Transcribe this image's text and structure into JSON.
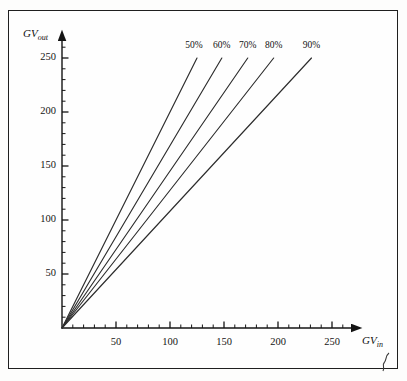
{
  "document": {
    "border_color": "#2a2a2a",
    "background": "#fefefe"
  },
  "chart_data": {
    "type": "line",
    "title": "",
    "subtitle": "",
    "xlabel": "GV",
    "xlabel_sub": "in",
    "ylabel": "GV",
    "ylabel_sub": "out",
    "xlim": [
      0,
      265
    ],
    "ylim": [
      0,
      262
    ],
    "x_major_ticks": [
      50,
      100,
      150,
      200,
      250
    ],
    "x_tick_labels": [
      "50",
      "100",
      "150",
      "200",
      "250"
    ],
    "y_major_ticks": [
      50,
      100,
      150,
      200,
      250
    ],
    "y_tick_labels": [
      "50",
      "100",
      "150",
      "200",
      "250"
    ],
    "minor_tick_interval": 10,
    "grid": false,
    "legend_position": "line-end-labels",
    "line_color": "#2c2c2c",
    "series": [
      {
        "name": "50%",
        "label": "50%",
        "x": [
          0,
          125
        ],
        "values": [
          0,
          250
        ],
        "slope": 2.0
      },
      {
        "name": "60%",
        "label": "60%",
        "x": [
          0,
          148
        ],
        "values": [
          0,
          250
        ],
        "slope": 1.69
      },
      {
        "name": "70%",
        "label": "70%",
        "x": [
          0,
          172
        ],
        "values": [
          0,
          250
        ],
        "slope": 1.45
      },
      {
        "name": "80%",
        "label": "80%",
        "x": [
          0,
          196
        ],
        "values": [
          0,
          250
        ],
        "slope": 1.28
      },
      {
        "name": "90%",
        "label": "90%",
        "x": [
          0,
          231
        ],
        "values": [
          0,
          250
        ],
        "slope": 1.08
      }
    ]
  }
}
